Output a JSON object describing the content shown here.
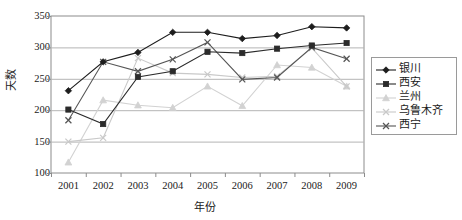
{
  "chart_data": {
    "type": "line",
    "title": "",
    "xlabel": "年份",
    "ylabel": "天数",
    "categories": [
      "2001",
      "2002",
      "2003",
      "2004",
      "2005",
      "2006",
      "2007",
      "2008",
      "2009"
    ],
    "ylim": [
      100,
      350
    ],
    "yticks": [
      100,
      150,
      200,
      250,
      300,
      350
    ],
    "grid": true,
    "legend_position": "right",
    "series": [
      {
        "name": "银川",
        "color": "#1d1d1d",
        "marker": "diamond",
        "values": [
          231,
          277,
          292,
          324,
          324,
          314,
          319,
          333,
          331
        ]
      },
      {
        "name": "西安",
        "color": "#2b2b2b",
        "marker": "square",
        "values": [
          201,
          178,
          253,
          262,
          293,
          291,
          298,
          303,
          307
        ]
      },
      {
        "name": "兰州",
        "color": "#d2d2d2",
        "marker": "triangle",
        "values": [
          117,
          216,
          208,
          204,
          238,
          207,
          272,
          268,
          238
        ]
      },
      {
        "name": "乌鲁木齐",
        "color": "#c9c9c9",
        "marker": "cross",
        "values": [
          150,
          156,
          283,
          259,
          257,
          252,
          254,
          299,
          238
        ]
      },
      {
        "name": "西宁",
        "color": "#555555",
        "marker": "cross",
        "values": [
          184,
          277,
          262,
          281,
          308,
          249,
          252,
          300,
          282
        ]
      }
    ]
  },
  "axis": {
    "y_title": "天数",
    "x_title": "年份"
  },
  "legend": {
    "items": [
      {
        "label": "银川"
      },
      {
        "label": "西安"
      },
      {
        "label": "兰州"
      },
      {
        "label": "乌鲁木齐"
      },
      {
        "label": "西宁"
      }
    ]
  }
}
